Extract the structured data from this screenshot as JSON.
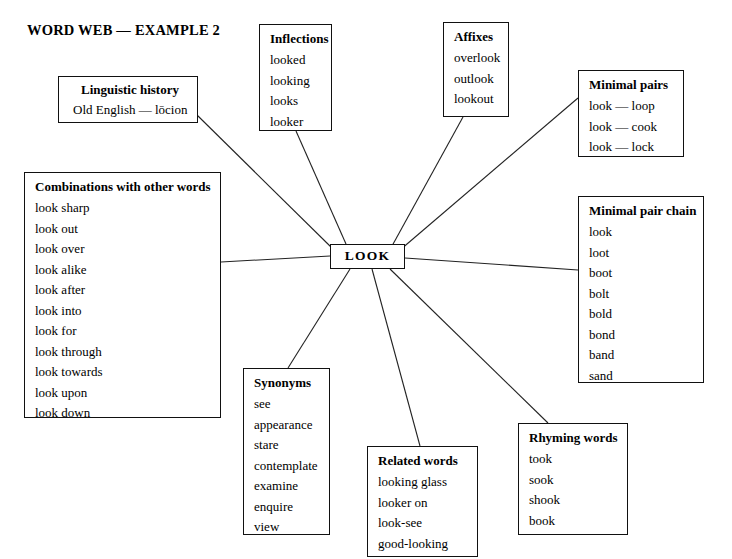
{
  "title": "WORD WEB — EXAMPLE 2",
  "center": {
    "label": "LOOK"
  },
  "nodes": {
    "linguistic_history": {
      "title": "Linguistic history",
      "items": [
        "Old English — lōcion"
      ]
    },
    "inflections": {
      "title": "Inflections",
      "items": [
        "looked",
        "looking",
        "looks",
        "looker"
      ]
    },
    "affixes": {
      "title": "Affixes",
      "items": [
        "overlook",
        "outlook",
        "lookout"
      ]
    },
    "minimal_pairs": {
      "title": "Minimal pairs",
      "items": [
        "look — loop",
        "look — cook",
        "look — lock"
      ]
    },
    "minimal_pair_chain": {
      "title": "Minimal pair chain",
      "items": [
        "look",
        "loot",
        "boot",
        "bolt",
        "bold",
        "bond",
        "band",
        "sand"
      ]
    },
    "combinations": {
      "title": "Combinations with other words",
      "items": [
        "look sharp",
        "look out",
        "look over",
        "look alike",
        "look after",
        "look into",
        "look for",
        "look through",
        "look towards",
        "look upon",
        "look down"
      ]
    },
    "synonyms": {
      "title": "Synonyms",
      "items": [
        "see",
        "appearance",
        "stare",
        "contemplate",
        "examine",
        "enquire",
        "view"
      ]
    },
    "related_words": {
      "title": "Related words",
      "items": [
        "looking glass",
        "looker on",
        "look-see",
        "good-looking"
      ]
    },
    "rhyming_words": {
      "title": "Rhyming words",
      "items": [
        "took",
        "sook",
        "shook",
        "book"
      ]
    }
  },
  "colors": {
    "ink": "#111111",
    "background": "#ffffff"
  }
}
